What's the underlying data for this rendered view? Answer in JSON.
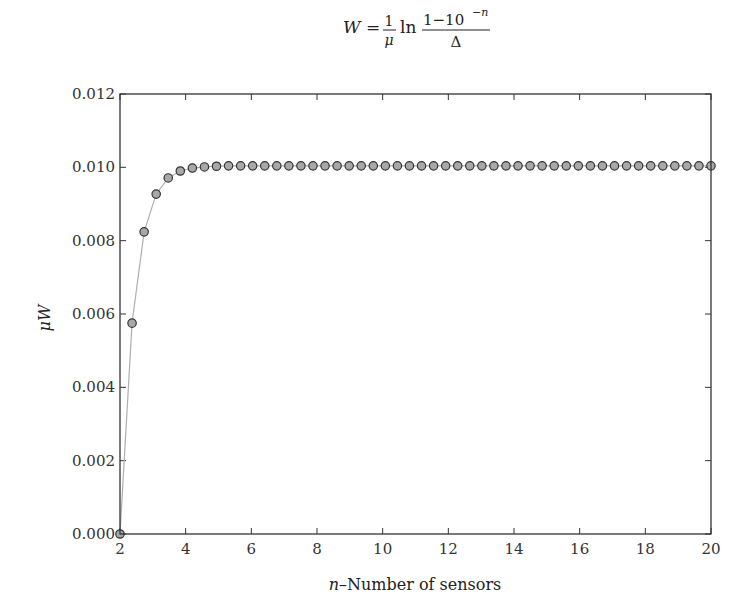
{
  "chart_data": {
    "type": "line",
    "title": {
      "lhs": "W",
      "equals": "=",
      "frac1_num": "1",
      "frac1_den": "μ",
      "ln": "ln",
      "frac2_num": "1−10",
      "frac2_num_exp": "−n",
      "frac2_den": "Δ",
      "full_text": "W = (1/μ) ln ((1−10^−n)/Δ)"
    },
    "xlabel": {
      "var": "n",
      "text": "–Number of sensors"
    },
    "ylabel": {
      "mu": "μ",
      "var": "W"
    },
    "xlim": [
      2,
      20
    ],
    "ylim": [
      0,
      0.012
    ],
    "xticks": [
      2,
      4,
      6,
      8,
      10,
      12,
      14,
      16,
      18,
      20
    ],
    "xtick_labels": [
      "2",
      "4",
      "6",
      "8",
      "10",
      "12",
      "14",
      "16",
      "18",
      "20"
    ],
    "yticks": [
      0,
      0.002,
      0.004,
      0.006,
      0.008,
      0.01,
      0.012
    ],
    "ytick_labels": [
      "0.000",
      "0.002",
      "0.004",
      "0.006",
      "0.008",
      "0.010",
      "0.012"
    ],
    "grid": false,
    "legend": null,
    "marker": "circle",
    "colors": {
      "marker_fill": "#a8a8a8",
      "marker_edge": "#333333",
      "line": "#b0b0b0",
      "axes": "#333333"
    },
    "series": [
      {
        "name": "μW",
        "x_start": 2,
        "x_end": 20,
        "num_points": 50,
        "y": [
          0.0,
          0.00575,
          0.00824,
          0.00927,
          0.00971,
          0.0099,
          0.00998,
          0.01001,
          0.01003,
          0.01004,
          0.01004,
          0.01004,
          0.01004,
          0.01004,
          0.01004,
          0.01004,
          0.01004,
          0.01004,
          0.01004,
          0.01004,
          0.01004,
          0.01004,
          0.01004,
          0.01004,
          0.01004,
          0.01004,
          0.01004,
          0.01004,
          0.01004,
          0.01004,
          0.01004,
          0.01004,
          0.01004,
          0.01004,
          0.01004,
          0.01004,
          0.01004,
          0.01004,
          0.01004,
          0.01004,
          0.01004,
          0.01004,
          0.01004,
          0.01004,
          0.01004,
          0.01004,
          0.01004,
          0.01004,
          0.01004,
          0.01004
        ]
      }
    ]
  }
}
